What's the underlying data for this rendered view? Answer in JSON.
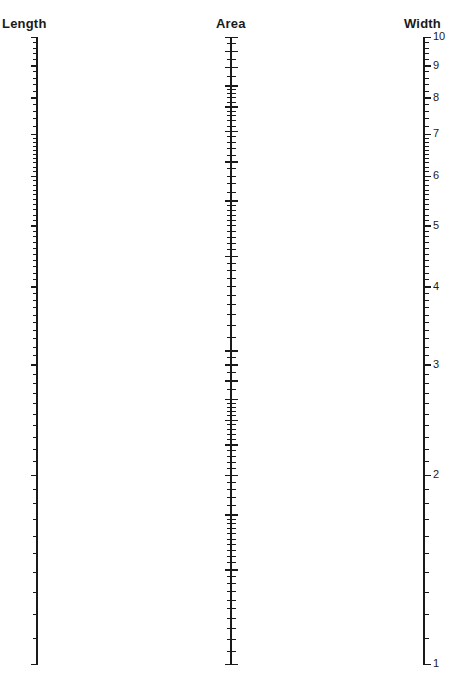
{
  "diagram": {
    "type": "nomogram",
    "scales": [
      {
        "id": "length",
        "title": "Length",
        "axis_x": 37,
        "orientation": "ticks-left-labels-left",
        "range": [
          1,
          10
        ],
        "pixel_range": [
          664,
          37
        ],
        "labels": [
          "1",
          "2",
          "3",
          "4",
          "5",
          "6",
          "7",
          "8",
          "9",
          "10"
        ],
        "label_values": [
          1,
          2,
          3,
          4,
          5,
          6,
          7,
          8,
          9,
          10
        ]
      },
      {
        "id": "area",
        "title": "Area",
        "axis_x": 231,
        "orientation": "ticks-both-labels-left",
        "range": [
          1,
          100
        ],
        "pixel_range": [
          664,
          37
        ],
        "labels": [
          "1",
          "2",
          "3",
          "4",
          "5",
          "6",
          "7",
          "8",
          "9",
          "10",
          "20",
          "30",
          "40",
          "50",
          "60",
          "70",
          "80",
          "90",
          "100"
        ],
        "label_values": [
          1,
          2,
          3,
          4,
          5,
          6,
          7,
          8,
          9,
          10,
          20,
          30,
          40,
          50,
          60,
          70,
          80,
          90,
          100
        ]
      },
      {
        "id": "width",
        "title": "Width",
        "axis_x": 424,
        "orientation": "ticks-right-labels-right",
        "range": [
          1,
          10
        ],
        "pixel_range": [
          664,
          37
        ],
        "labels": [
          "1",
          "2",
          "3",
          "4",
          "5",
          "6",
          "7",
          "8",
          "9",
          "10"
        ],
        "label_values": [
          1,
          2,
          3,
          4,
          5,
          6,
          7,
          8,
          9,
          10
        ]
      }
    ],
    "ink_color": "#1a1a1a",
    "background": "#ffffff"
  }
}
